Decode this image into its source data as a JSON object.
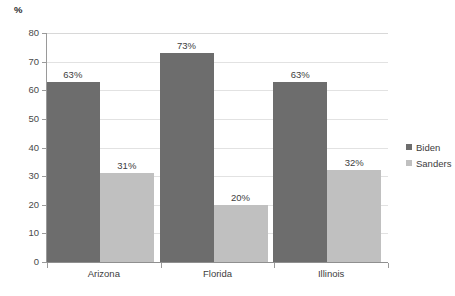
{
  "chart_data": {
    "type": "bar",
    "title": "",
    "subtitle": "",
    "xlabel": "",
    "ylabel": "%",
    "ylim": [
      0,
      80
    ],
    "ytick_step": 10,
    "ytick_labels": [
      "0",
      "10",
      "20",
      "30",
      "40",
      "50",
      "60",
      "70",
      "80"
    ],
    "grid": true,
    "legend_position": "right",
    "categories": [
      "Arizona",
      "Florida",
      "Illinois"
    ],
    "series": [
      {
        "name": "Biden",
        "color": "#6d6d6d",
        "values": [
          63,
          73,
          63
        ],
        "labels": [
          "63%",
          "73%",
          "63%"
        ]
      },
      {
        "name": "Sanders",
        "color": "#c0c0c0",
        "values": [
          31,
          20,
          32
        ],
        "labels": [
          "31%",
          "20%",
          "32%"
        ]
      }
    ]
  },
  "axis": {
    "y_title": "%"
  },
  "colors": {
    "biden": "#6d6d6d",
    "sanders": "#c0c0c0",
    "gridline": "#e2e2e2",
    "axis": "#9a9a9a",
    "background": "#ffffff",
    "text": "#3d3d3d"
  }
}
